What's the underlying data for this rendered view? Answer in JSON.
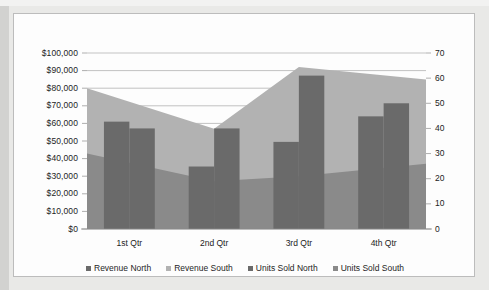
{
  "chart_data": {
    "type": "bar",
    "title": "",
    "subtitle": "",
    "xlabel": "",
    "ylabel": "",
    "categories": [
      "1st Qtr",
      "2nd Qtr",
      "3rd Qtr",
      "4th Qtr"
    ],
    "series": [
      {
        "name": "Revenue North",
        "type": "column",
        "axis": "left",
        "color": "#6a6a6a",
        "values": [
          61000,
          35500,
          49500,
          64000
        ]
      },
      {
        "name": "Revenue South",
        "type": "area",
        "axis": "left",
        "color": "#b2b2b2",
        "values": [
          80000,
          57000,
          92000,
          85000
        ]
      },
      {
        "name": "Units Sold North",
        "type": "column",
        "axis": "right",
        "color": "#6a6a6a",
        "values": [
          40,
          40,
          61,
          50
        ]
      },
      {
        "name": "Units Sold South",
        "type": "area",
        "axis": "right",
        "color": "#8a8a8a",
        "values": [
          30,
          19,
          21,
          26
        ]
      }
    ],
    "left_axis": {
      "ticks": [
        "$0",
        "$10,000",
        "$20,000",
        "$30,000",
        "$40,000",
        "$50,000",
        "$60,000",
        "$70,000",
        "$80,000",
        "$90,000",
        "$100,000"
      ],
      "min": 0,
      "max": 100000,
      "step": 10000,
      "format": "currency"
    },
    "right_axis": {
      "ticks": [
        "0",
        "10",
        "20",
        "30",
        "40",
        "50",
        "60",
        "70"
      ],
      "min": 0,
      "max": 70,
      "step": 10
    },
    "grid": true,
    "legend_position": "bottom",
    "legend": [
      "Revenue North",
      "Revenue South",
      "Units Sold North",
      "Units Sold South"
    ]
  },
  "colors": {
    "page_background": "#e9e9e7",
    "chart_background": "#fdfdfd",
    "chart_border": "#bcbcbc",
    "gridline": "#a9a9a9",
    "axis_text": "#232323",
    "series_dark": "#6a6a6a",
    "series_light": "#b2b2b2",
    "series_mid": "#8a8a8a"
  }
}
